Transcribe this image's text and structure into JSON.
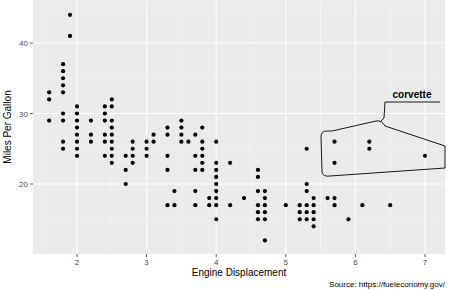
{
  "chart_data": {
    "type": "scatter",
    "title": "",
    "xlabel": "Engine Displacement",
    "ylabel": "Miles Per Gallon",
    "caption": "Source: https://fueleconomy.gov/",
    "xlim": [
      1.4,
      7.3
    ],
    "ylim": [
      11,
      45
    ],
    "x_ticks": [
      2,
      3,
      4,
      5,
      6,
      7
    ],
    "y_ticks": [
      20,
      30,
      40
    ],
    "grid": true,
    "background": "#ebebeb",
    "point_color": "#000000",
    "annotation": {
      "label": "corvette",
      "shape": "hull",
      "points": [
        [
          5.7,
          26
        ],
        [
          5.7,
          23
        ],
        [
          6.2,
          26
        ],
        [
          6.2,
          25
        ],
        [
          7.0,
          24
        ]
      ]
    },
    "points": [
      [
        1.6,
        33
      ],
      [
        1.6,
        32
      ],
      [
        1.6,
        29
      ],
      [
        1.8,
        29
      ],
      [
        1.8,
        30
      ],
      [
        1.8,
        26
      ],
      [
        1.8,
        25
      ],
      [
        1.8,
        33
      ],
      [
        1.8,
        34
      ],
      [
        1.8,
        35
      ],
      [
        1.8,
        36
      ],
      [
        1.8,
        37
      ],
      [
        1.9,
        44
      ],
      [
        1.9,
        41
      ],
      [
        2.0,
        31
      ],
      [
        2.0,
        30
      ],
      [
        2.0,
        29
      ],
      [
        2.0,
        28
      ],
      [
        2.0,
        27
      ],
      [
        2.0,
        26
      ],
      [
        2.0,
        25
      ],
      [
        2.0,
        24
      ],
      [
        2.2,
        29
      ],
      [
        2.2,
        27
      ],
      [
        2.2,
        26
      ],
      [
        2.4,
        31
      ],
      [
        2.4,
        30
      ],
      [
        2.4,
        27
      ],
      [
        2.4,
        26
      ],
      [
        2.4,
        24
      ],
      [
        2.4,
        29
      ],
      [
        2.5,
        32
      ],
      [
        2.5,
        31
      ],
      [
        2.5,
        29
      ],
      [
        2.5,
        28
      ],
      [
        2.5,
        27
      ],
      [
        2.5,
        26
      ],
      [
        2.5,
        25
      ],
      [
        2.5,
        24
      ],
      [
        2.5,
        23
      ],
      [
        2.7,
        24
      ],
      [
        2.7,
        22
      ],
      [
        2.7,
        20
      ],
      [
        2.8,
        26
      ],
      [
        2.8,
        25
      ],
      [
        2.8,
        24
      ],
      [
        2.8,
        23
      ],
      [
        3.0,
        26
      ],
      [
        3.0,
        25
      ],
      [
        3.0,
        24
      ],
      [
        3.1,
        27
      ],
      [
        3.1,
        26
      ],
      [
        3.3,
        28
      ],
      [
        3.3,
        27
      ],
      [
        3.3,
        24
      ],
      [
        3.3,
        22
      ],
      [
        3.3,
        17
      ],
      [
        3.4,
        19
      ],
      [
        3.4,
        17
      ],
      [
        3.5,
        29
      ],
      [
        3.5,
        28
      ],
      [
        3.5,
        27
      ],
      [
        3.5,
        26
      ],
      [
        3.6,
        26
      ],
      [
        3.7,
        27
      ],
      [
        3.7,
        24
      ],
      [
        3.7,
        22
      ],
      [
        3.7,
        19
      ],
      [
        3.7,
        17
      ],
      [
        3.8,
        28
      ],
      [
        3.8,
        26
      ],
      [
        3.8,
        25
      ],
      [
        3.8,
        24
      ],
      [
        3.8,
        23
      ],
      [
        3.8,
        22
      ],
      [
        3.9,
        18
      ],
      [
        3.9,
        17
      ],
      [
        4.0,
        26
      ],
      [
        4.0,
        23
      ],
      [
        4.0,
        22
      ],
      [
        4.0,
        21
      ],
      [
        4.0,
        20
      ],
      [
        4.0,
        19
      ],
      [
        4.0,
        18
      ],
      [
        4.0,
        17
      ],
      [
        4.0,
        15
      ],
      [
        4.2,
        23
      ],
      [
        4.2,
        17
      ],
      [
        4.4,
        18
      ],
      [
        4.6,
        22
      ],
      [
        4.6,
        21
      ],
      [
        4.6,
        19
      ],
      [
        4.6,
        17
      ],
      [
        4.6,
        16
      ],
      [
        4.6,
        15
      ],
      [
        4.7,
        19
      ],
      [
        4.7,
        18
      ],
      [
        4.7,
        17
      ],
      [
        4.7,
        16
      ],
      [
        4.7,
        15
      ],
      [
        4.7,
        12
      ],
      [
        5.0,
        17
      ],
      [
        5.2,
        17
      ],
      [
        5.2,
        16
      ],
      [
        5.2,
        15
      ],
      [
        5.3,
        25
      ],
      [
        5.3,
        20
      ],
      [
        5.3,
        19
      ],
      [
        5.3,
        17
      ],
      [
        5.3,
        16
      ],
      [
        5.3,
        15
      ],
      [
        5.4,
        18
      ],
      [
        5.4,
        17
      ],
      [
        5.4,
        16
      ],
      [
        5.4,
        15
      ],
      [
        5.4,
        14
      ],
      [
        5.6,
        18
      ],
      [
        5.7,
        26
      ],
      [
        5.7,
        23
      ],
      [
        5.7,
        18
      ],
      [
        5.7,
        17
      ],
      [
        5.9,
        15
      ],
      [
        6.1,
        17
      ],
      [
        6.2,
        26
      ],
      [
        6.2,
        25
      ],
      [
        6.5,
        17
      ],
      [
        7.0,
        24
      ]
    ]
  }
}
